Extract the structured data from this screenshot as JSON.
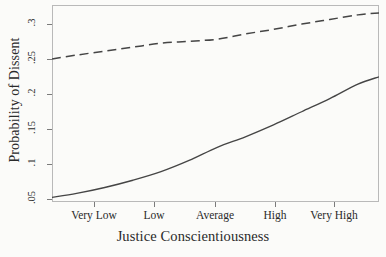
{
  "chart_data": {
    "type": "line",
    "title": "",
    "xlabel": "Justice Conscientiousness",
    "ylabel": "Probability of Dissent",
    "xtick_labels": [
      "Very Low",
      "Low",
      "Average",
      "High",
      "Very High"
    ],
    "xtick_values": [
      -2,
      -1,
      0,
      1,
      2
    ],
    "ytick_labels": [
      ".05",
      ".1",
      ".15",
      ".2",
      ".25",
      ".3"
    ],
    "ytick_values": [
      0.05,
      0.1,
      0.15,
      0.2,
      0.25,
      0.3
    ],
    "xlim": [
      -2.35,
      2.3
    ],
    "ylim": [
      0.035,
      0.334
    ],
    "grid": false,
    "legend": "none",
    "series": [
      {
        "name": "solid-curve",
        "style": "solid",
        "color": "#454545",
        "x": [
          -2.35,
          -2.0,
          -1.6,
          -1.2,
          -0.8,
          -0.4,
          0.0,
          0.4,
          0.8,
          1.2,
          1.6,
          2.0,
          2.3
        ],
        "values": [
          0.042,
          0.048,
          0.057,
          0.068,
          0.081,
          0.098,
          0.118,
          0.134,
          0.152,
          0.172,
          0.192,
          0.214,
          0.225
        ]
      },
      {
        "name": "dashed-curve",
        "style": "dashed",
        "color": "#454545",
        "x": [
          -2.35,
          -2.0,
          -1.6,
          -1.2,
          -0.8,
          -0.4,
          0.0,
          0.4,
          0.8,
          1.2,
          1.6,
          2.0,
          2.3
        ],
        "values": [
          0.252,
          0.258,
          0.264,
          0.27,
          0.276,
          0.279,
          0.282,
          0.29,
          0.297,
          0.305,
          0.312,
          0.319,
          0.322
        ]
      }
    ]
  },
  "axes": {
    "y_title": "Probability of Dissent",
    "x_title": "Justice Conscientiousness",
    "y_ticks": [
      {
        "label": ".3",
        "top": 24
      },
      {
        "label": ".25",
        "top": 59
      },
      {
        "label": ".2",
        "top": 94
      },
      {
        "label": ".15",
        "top": 129
      },
      {
        "label": ".1",
        "top": 164
      },
      {
        "label": ".05",
        "top": 199
      }
    ],
    "x_ticks": [
      {
        "label": "Very Low",
        "left": 94
      },
      {
        "label": "Low",
        "left": 154
      },
      {
        "label": "Average",
        "left": 215
      },
      {
        "label": "High",
        "left": 275
      },
      {
        "label": "Very High",
        "left": 334
      }
    ]
  },
  "style": {
    "frame_color": "#b9b9b9",
    "line_color": "#454545",
    "background": "#fbfbf9"
  }
}
